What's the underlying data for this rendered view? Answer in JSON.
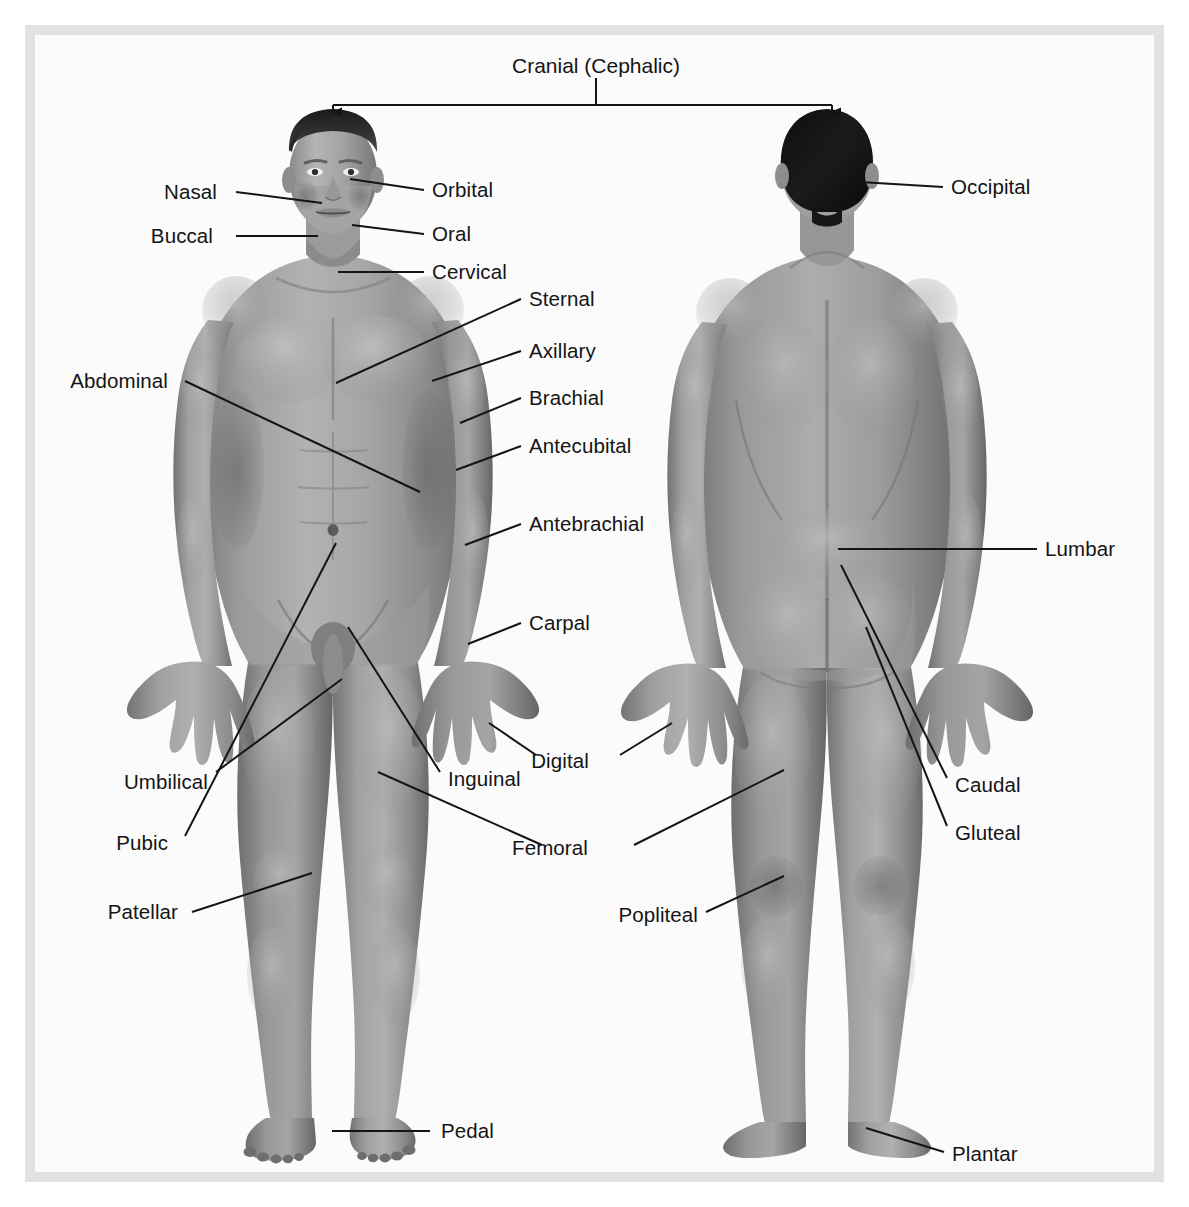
{
  "figure": {
    "title": "Cranial (Cephalic)",
    "frame_color": "#e2e2e2",
    "background_color": "#fbfbfb",
    "line_color": "#141414",
    "skin_color": "#8f8f8f"
  },
  "views": {
    "anterior": "Anterior view",
    "posterior": "Posterior view"
  },
  "labels": {
    "nasal": "Nasal",
    "buccal": "Buccal",
    "orbital": "Orbital",
    "oral": "Oral",
    "cervical": "Cervical",
    "sternal": "Sternal",
    "axillary": "Axillary",
    "brachial": "Brachial",
    "antecubital": "Antecubital",
    "antebrachial": "Antebrachial",
    "abdominal": "Abdominal",
    "carpal": "Carpal",
    "umbilical": "Umbilical",
    "pubic": "Pubic",
    "inguinal": "Inguinal",
    "digital": "Digital",
    "femoral": "Femoral",
    "patellar": "Patellar",
    "pedal": "Pedal",
    "occipital": "Occipital",
    "lumbar": "Lumbar",
    "caudal": "Caudal",
    "gluteal": "Gluteal",
    "popliteal": "Popliteal",
    "plantar": "Plantar"
  },
  "label_positions": {
    "title": {
      "x": 596,
      "y": 66
    },
    "nasal": {
      "x": 217,
      "y": 192
    },
    "buccal": {
      "x": 213,
      "y": 236
    },
    "orbital": {
      "x": 432,
      "y": 190
    },
    "oral": {
      "x": 432,
      "y": 234
    },
    "cervical": {
      "x": 432,
      "y": 272
    },
    "sternal": {
      "x": 529,
      "y": 299
    },
    "axillary": {
      "x": 529,
      "y": 351
    },
    "brachial": {
      "x": 529,
      "y": 398
    },
    "antecubital": {
      "x": 529,
      "y": 446
    },
    "antebrachial": {
      "x": 529,
      "y": 524
    },
    "abdominal": {
      "x": 168,
      "y": 381
    },
    "carpal": {
      "x": 529,
      "y": 623
    },
    "umbilical": {
      "x": 208,
      "y": 782
    },
    "pubic": {
      "x": 168,
      "y": 843
    },
    "inguinal": {
      "x": 448,
      "y": 779
    },
    "digital": {
      "x": 560,
      "y": 761
    },
    "femoral": {
      "x": 550,
      "y": 848
    },
    "patellar": {
      "x": 178,
      "y": 912
    },
    "pedal": {
      "x": 441,
      "y": 1131
    },
    "occipital": {
      "x": 951,
      "y": 187
    },
    "lumbar": {
      "x": 1045,
      "y": 549
    },
    "caudal": {
      "x": 955,
      "y": 785
    },
    "gluteal": {
      "x": 955,
      "y": 833
    },
    "popliteal": {
      "x": 698,
      "y": 915
    },
    "plantar": {
      "x": 952,
      "y": 1154
    }
  }
}
